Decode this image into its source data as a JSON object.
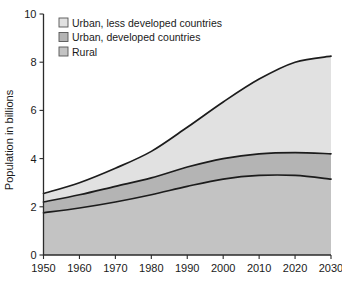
{
  "chart_data": {
    "type": "area",
    "stacked": true,
    "title": "",
    "xlabel": "",
    "ylabel": "Population in billions",
    "xlim": [
      1950,
      2030
    ],
    "ylim": [
      0,
      10
    ],
    "grid": false,
    "legend_position": "top-left-inside",
    "x": [
      1950,
      1960,
      1970,
      1980,
      1990,
      2000,
      2010,
      2020,
      2030
    ],
    "xticks": [
      "1950",
      "1960",
      "1970",
      "1980",
      "1990",
      "2000",
      "2010",
      "2020",
      "2030"
    ],
    "yticks": [
      "0",
      "2",
      "4",
      "6",
      "8",
      "10"
    ],
    "ytick_values": [
      0,
      2,
      4,
      6,
      8,
      10
    ],
    "series": [
      {
        "name": "Rural",
        "color": "#c3c3c3",
        "values": [
          1.75,
          1.95,
          2.2,
          2.5,
          2.85,
          3.15,
          3.3,
          3.3,
          3.15
        ],
        "cumulative": [
          1.75,
          1.95,
          2.2,
          2.5,
          2.85,
          3.15,
          3.3,
          3.3,
          3.15
        ]
      },
      {
        "name": "Urban, developed countries",
        "color": "#b4b4b4",
        "values": [
          0.45,
          0.55,
          0.65,
          0.7,
          0.8,
          0.85,
          0.9,
          0.95,
          1.05
        ],
        "cumulative": [
          2.2,
          2.5,
          2.85,
          3.2,
          3.65,
          4.0,
          4.2,
          4.25,
          4.2
        ]
      },
      {
        "name": "Urban, less developed countries",
        "color": "#e1e1e1",
        "values": [
          0.35,
          0.5,
          0.75,
          1.1,
          1.65,
          2.35,
          3.1,
          3.75,
          4.05
        ],
        "cumulative": [
          2.55,
          3.0,
          3.6,
          4.3,
          5.3,
          6.35,
          7.3,
          8.0,
          8.25
        ]
      }
    ],
    "legend_entries": [
      {
        "label": "Urban, less developed countries",
        "color": "#e1e1e1"
      },
      {
        "label": "Urban, developed countries",
        "color": "#b4b4b4"
      },
      {
        "label": "Rural",
        "color": "#c3c3c3"
      }
    ]
  }
}
